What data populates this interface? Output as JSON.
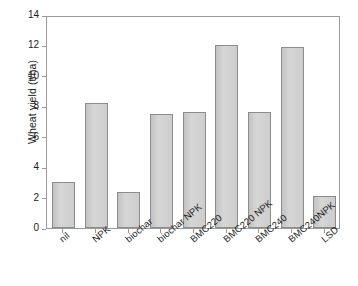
{
  "chart_data": {
    "type": "bar",
    "title": "",
    "xlabel": "",
    "ylabel": "Wheat yield (t/ha)",
    "ylim": [
      0,
      14
    ],
    "yticks": [
      0,
      2,
      4,
      6,
      8,
      10,
      12,
      14
    ],
    "ytick_labels": [
      "0",
      "2",
      "4",
      "6",
      "8",
      "10",
      "12",
      "14"
    ],
    "grid": false,
    "legend": null,
    "bar_color": "#cfcfcf",
    "bar_edge_color": "#8c8c8c",
    "categories": [
      "nil",
      "NPK",
      "biochar",
      "biochar NPK",
      "BMC220",
      "BMC220 NPK",
      "BMC240",
      "BMC240NPK",
      "LSD"
    ],
    "values": [
      3.0,
      8.2,
      2.4,
      7.5,
      7.6,
      12.0,
      7.6,
      11.9,
      2.1
    ]
  }
}
